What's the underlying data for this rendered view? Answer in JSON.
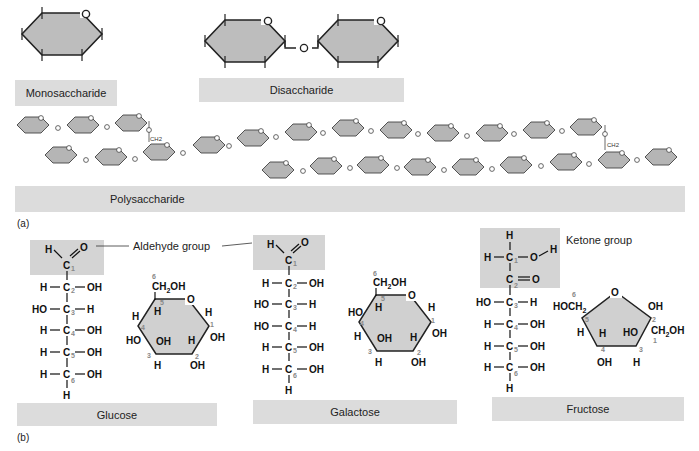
{
  "panel_a": {
    "tag": "(a)",
    "monosaccharide": {
      "label": "Monosaccharide",
      "ring_oxygen": "O"
    },
    "disaccharide": {
      "label": "Disaccharide",
      "linkage": "O"
    },
    "polysaccharide": {
      "label": "Polysaccharide",
      "linkage": "O",
      "branch_group": "CH2"
    }
  },
  "panel_b": {
    "tag": "(b)",
    "aldehyde_callout": "Aldehyde group",
    "ketone_callout": "Ketone group",
    "sugars": [
      {
        "name": "Glucose",
        "linear": [
          [
            "H",
            "C",
            "OH"
          ],
          [
            "HO",
            "C",
            "H"
          ],
          [
            "H",
            "C",
            "OH"
          ],
          [
            "H",
            "C",
            "OH"
          ],
          [
            "H",
            "C",
            "OH"
          ]
        ],
        "ring_labels": {
          "top": "CH2OH",
          "o": "O",
          "c1_h": "H",
          "c1_oh": "OH",
          "c2_h": "H",
          "c2_oh": "OH",
          "c3_oh": "OH",
          "c3_h": "H",
          "c4_h": "H",
          "c4_oh": "HO",
          "c5_h": "H"
        }
      },
      {
        "name": "Galactose",
        "linear": [
          [
            "H",
            "C",
            "OH"
          ],
          [
            "HO",
            "C",
            "H"
          ],
          [
            "HO",
            "C",
            "H"
          ],
          [
            "H",
            "C",
            "OH"
          ],
          [
            "H",
            "C",
            "OH"
          ]
        ],
        "ring_labels": {
          "top": "CH2OH",
          "o": "O",
          "c1_h": "H",
          "c1_oh": "OH",
          "c2_h": "H",
          "c2_oh": "OH",
          "c3_oh": "OH",
          "c3_h": "H",
          "c4_h": "H",
          "c4_oh": "HO",
          "c5_h": "H"
        }
      },
      {
        "name": "Fructose",
        "linear": [
          [
            "HO",
            "C",
            "H"
          ],
          [
            "H",
            "C",
            "OH"
          ],
          [
            "H",
            "C",
            "OH"
          ],
          [
            "H",
            "C",
            "OH"
          ]
        ],
        "ring_labels": {
          "left": "HOCH2",
          "o": "O",
          "c2_oh": "OH",
          "c1": "CH2OH",
          "c3_ho": "HO",
          "c3_h": "H",
          "c4_h": "H",
          "c4_oh": "OH",
          "c5_h": "H"
        }
      }
    ]
  }
}
